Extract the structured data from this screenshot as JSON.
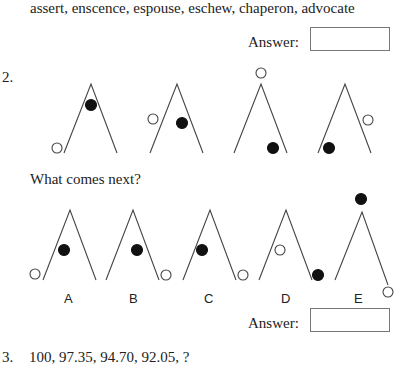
{
  "question1": {
    "words": "assert, enscence, espouse, eschew, chaperon, advocate",
    "answer_label": "Answer:",
    "answer_value": ""
  },
  "question2": {
    "number": "2.",
    "prompt": "What comes next?",
    "sequence": [
      {
        "index": 1,
        "filled_dot": "inside upper-left near apex",
        "open_dot": "outside bottom-left"
      },
      {
        "index": 2,
        "filled_dot": "inside middle-right",
        "open_dot": "outside left middle"
      },
      {
        "index": 3,
        "filled_dot": "inside bottom-right",
        "open_dot": "above apex"
      },
      {
        "index": 4,
        "filled_dot": "inside bottom-left",
        "open_dot": "outside right middle"
      }
    ],
    "options": [
      {
        "label": "A",
        "filled_dot": "inside middle-left",
        "open_dot": "outside bottom-left"
      },
      {
        "label": "B",
        "filled_dot": "inside middle",
        "open_dot": "outside bottom-right"
      },
      {
        "label": "C",
        "filled_dot": "inside middle-left",
        "open_dot": "outside bottom-right"
      },
      {
        "label": "D",
        "filled_dot": "outside bottom-right",
        "open_dot": "inside middle-left"
      },
      {
        "label": "E",
        "filled_dot": "above apex",
        "open_dot": "outside bottom-right end"
      }
    ],
    "answer_label": "Answer:",
    "answer_value": ""
  },
  "question3": {
    "number": "3.",
    "sequence": "100, 97.35, 94.70, 92.05, ?"
  }
}
